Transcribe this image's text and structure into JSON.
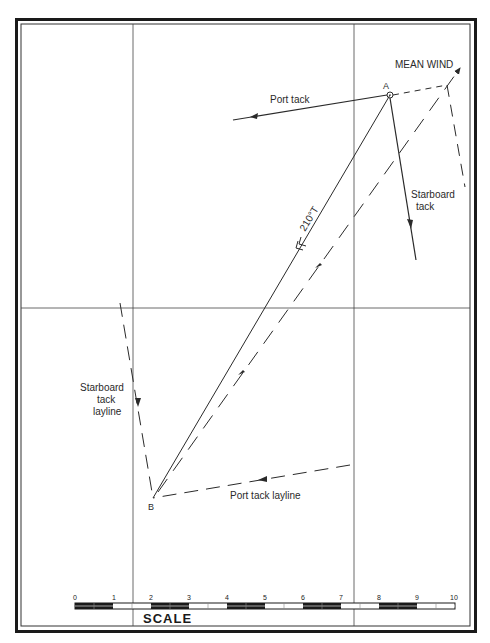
{
  "diagram": {
    "points": {
      "A": {
        "label": "A",
        "x": 390,
        "y": 95
      },
      "B": {
        "label": "B",
        "x": 153,
        "y": 498
      }
    },
    "labels": {
      "mean_wind": "MEAN WIND",
      "port_tack": "Port tack",
      "starboard_tack_line1": "Starboard",
      "starboard_tack_line2": "tack",
      "starboard_layline_line1": "Starboard",
      "starboard_layline_line2": "tack",
      "starboard_layline_line3": "layline",
      "port_layline": "Port tack layline",
      "bearing": "210°T"
    },
    "scale": {
      "title": "SCALE",
      "ticks": [
        "0",
        "1",
        "2",
        "3",
        "4",
        "5",
        "6",
        "7",
        "8",
        "9",
        "10"
      ]
    },
    "colors": {
      "line": "#2a2a2a",
      "frame": "#1a1a1a",
      "background": "#ffffff"
    }
  }
}
